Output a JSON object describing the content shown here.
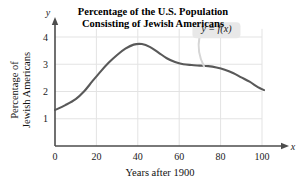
{
  "chart_data": {
    "type": "line",
    "title": "Percentage of the U.S. Population Consisting of Jewish Americans",
    "title_line1": "Percentage of the U.S. Population",
    "title_line2": "Consisting of Jewish Americans",
    "xlabel": "Years after 1900",
    "ylabel_line1": "Percentage of",
    "ylabel_line2": "Jewish Americans",
    "x_axis_name": "x",
    "y_axis_name": "y",
    "xticks": [
      0,
      20,
      40,
      60,
      80,
      100
    ],
    "yticks": [
      1,
      2,
      3,
      4
    ],
    "xlim": [
      0,
      108
    ],
    "ylim": [
      0,
      4.55
    ],
    "grid": true,
    "legend": "none",
    "annotation": "y = f(x)",
    "annotation_x": 78,
    "annotation_y": 4.25,
    "annotation_target_x": 72,
    "annotation_target_y": 2.92,
    "series": [
      {
        "name": "f(x)",
        "color": "#595959",
        "x": [
          0,
          5,
          10,
          14,
          18,
          22,
          26,
          30,
          34,
          38,
          42,
          46,
          50,
          54,
          58,
          62,
          66,
          70,
          74,
          78,
          82,
          86,
          90,
          94,
          98,
          101
        ],
        "y": [
          1.32,
          1.5,
          1.72,
          2.0,
          2.37,
          2.73,
          3.06,
          3.34,
          3.57,
          3.72,
          3.74,
          3.63,
          3.43,
          3.22,
          3.08,
          3.0,
          2.97,
          2.95,
          2.93,
          2.88,
          2.8,
          2.68,
          2.52,
          2.36,
          2.16,
          2.05
        ]
      }
    ]
  },
  "colors": {
    "curve": "#595959",
    "grid": "#e3e3e3",
    "axis": "#4d4d4d",
    "callout_bg": "#e8e8e8",
    "callout_tail": "#d6d6d6",
    "text": "#111111"
  }
}
